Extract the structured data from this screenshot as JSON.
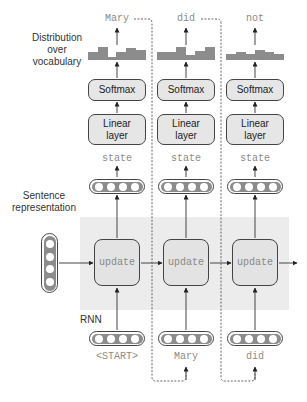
{
  "labels": {
    "distribution": "Distribution over vocabulary",
    "distribution_lines": [
      "Distribution",
      "over",
      "vocabulary"
    ],
    "sentence_representation_lines": [
      "Sentence",
      "representation"
    ],
    "rnn": "RNN"
  },
  "columns": [
    {
      "output_word": "Mary",
      "softmax": "Softmax",
      "linear_lines": [
        "Linear",
        "layer"
      ],
      "state": "state",
      "update": "update",
      "input_word": "<START>",
      "distribution_bars": [
        4,
        8,
        1,
        4,
        7,
        6
      ]
    },
    {
      "output_word": "did",
      "softmax": "Softmax",
      "linear_lines": [
        "Linear",
        "layer"
      ],
      "state": "state",
      "update": "update",
      "input_word": "Mary",
      "distribution_bars": [
        4,
        4,
        8,
        3,
        5,
        8
      ]
    },
    {
      "output_word": "not",
      "softmax": "Softmax",
      "linear_lines": [
        "Linear",
        "layer"
      ],
      "state": "state",
      "update": "update",
      "input_word": "did",
      "distribution_bars": [
        3,
        4,
        3,
        5,
        4,
        3
      ]
    }
  ],
  "colors": {
    "box_fill": "#e6e6e6",
    "region_fill": "#ececec",
    "bar_fill": "#8c8c8c",
    "stroke": "#444444",
    "word_text": "#8a8a8a"
  }
}
